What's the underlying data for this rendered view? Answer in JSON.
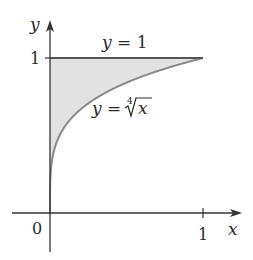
{
  "diagram": {
    "axes": {
      "x_label": "x",
      "y_label": "y",
      "origin_label": "0",
      "x_tick_label": "1",
      "y_tick_label": "1"
    },
    "curves": [
      {
        "name": "fourth-root",
        "label_prefix": "y = ",
        "radical_index": "4",
        "radicand": "x"
      },
      {
        "name": "horizontal-line",
        "label": "y = 1"
      }
    ],
    "shaded_region": {
      "description": "region between y = fourth-root of x and y = 1 for 0 ≤ x ≤ 1",
      "fill": "#e2e2e2"
    },
    "colors": {
      "axis": "#333333",
      "curve": "#8a8a8a",
      "line": "#555555",
      "shade": "#e2e2e2"
    }
  }
}
